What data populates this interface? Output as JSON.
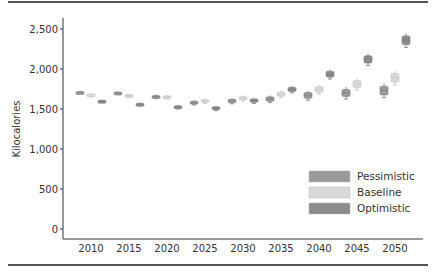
{
  "chart_data": {
    "type": "box",
    "title": "",
    "xlabel": "",
    "ylabel": "Kilocalories",
    "ylim": [
      0,
      2600
    ],
    "yticks": [
      0,
      500,
      1000,
      1500,
      2000,
      2500
    ],
    "ytick_labels": [
      "0",
      "500",
      "1,000",
      "1,500",
      "2,000",
      "2,500"
    ],
    "categories": [
      "2010",
      "2015",
      "2020",
      "2025",
      "2030",
      "2035",
      "2040",
      "2045",
      "2050"
    ],
    "grid": false,
    "legend_position": "lower right",
    "series": [
      {
        "name": "Pessimistic",
        "color": "#9a9a9a",
        "values": [
          1710,
          1700,
          1655,
          1580,
          1600,
          1625,
          1670,
          1700,
          1730
        ]
      },
      {
        "name": "Baseline",
        "color": "#d9d9d9",
        "values": [
          1680,
          1670,
          1650,
          1600,
          1635,
          1685,
          1745,
          1810,
          1890
        ]
      },
      {
        "name": "Optimistic",
        "color": "#8c8c8c",
        "values": [
          1600,
          1560,
          1525,
          1510,
          1605,
          1745,
          1935,
          2120,
          2360
        ]
      }
    ],
    "box_half_range": [
      15,
      20,
      25,
      30,
      35,
      45,
      60,
      75,
      90
    ]
  },
  "legend": {
    "items": [
      {
        "label": "Pessimistic",
        "color": "#9a9a9a"
      },
      {
        "label": "Baseline",
        "color": "#d9d9d9"
      },
      {
        "label": "Optimistic",
        "color": "#8c8c8c"
      }
    ]
  }
}
